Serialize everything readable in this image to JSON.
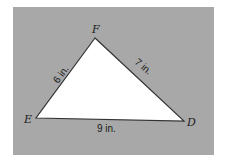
{
  "diagram": {
    "type": "triangle",
    "background_color": "#a8a8a8",
    "fill_color": "#ffffff",
    "stroke_color": "#333333",
    "vertices": [
      {
        "label": "F",
        "x": 95,
        "y": 38
      },
      {
        "label": "E",
        "x": 36,
        "y": 118
      },
      {
        "label": "D",
        "x": 184,
        "y": 121
      }
    ],
    "sides": [
      {
        "from": "E",
        "to": "F",
        "label": "6 in."
      },
      {
        "from": "F",
        "to": "D",
        "label": "7 in."
      },
      {
        "from": "E",
        "to": "D",
        "label": "9 in."
      }
    ]
  }
}
